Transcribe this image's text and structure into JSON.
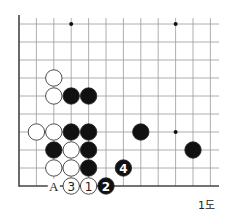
{
  "diagram": {
    "caption": "1도",
    "grid": {
      "origin_x": 19,
      "origin_y": 24,
      "spacing_x": 17.4,
      "spacing_y": 18.0,
      "cols": 12,
      "rows": 10,
      "line_color": "#9a9a9a",
      "edge_color": "#444444"
    },
    "star_points": [
      [
        3,
        0
      ],
      [
        9,
        0
      ],
      [
        9,
        6
      ]
    ],
    "stones": [
      {
        "color": "white",
        "col": 2,
        "row": 3
      },
      {
        "color": "white",
        "col": 2,
        "row": 4
      },
      {
        "color": "black",
        "col": 3,
        "row": 4
      },
      {
        "color": "black",
        "col": 4,
        "row": 4
      },
      {
        "color": "white",
        "col": 1,
        "row": 6
      },
      {
        "color": "white",
        "col": 2,
        "row": 6
      },
      {
        "color": "black",
        "col": 3,
        "row": 6
      },
      {
        "color": "black",
        "col": 4,
        "row": 6
      },
      {
        "color": "black",
        "col": 7,
        "row": 6
      },
      {
        "color": "black",
        "col": 2,
        "row": 7
      },
      {
        "color": "white",
        "col": 3,
        "row": 7
      },
      {
        "color": "black",
        "col": 4,
        "row": 7
      },
      {
        "color": "black",
        "col": 10,
        "row": 7
      },
      {
        "color": "white",
        "col": 2,
        "row": 8
      },
      {
        "color": "white",
        "col": 3,
        "row": 8
      },
      {
        "color": "black",
        "col": 4,
        "row": 8
      },
      {
        "color": "black",
        "col": 6,
        "row": 8,
        "label": "4"
      },
      {
        "color": "white",
        "col": 3,
        "row": 9,
        "label": "3"
      },
      {
        "color": "white",
        "col": 4,
        "row": 9,
        "label": "1"
      },
      {
        "color": "black",
        "col": 5,
        "row": 9,
        "label": "2"
      }
    ],
    "markers": [
      {
        "col": 2,
        "row": 9,
        "label": "A"
      }
    ]
  }
}
